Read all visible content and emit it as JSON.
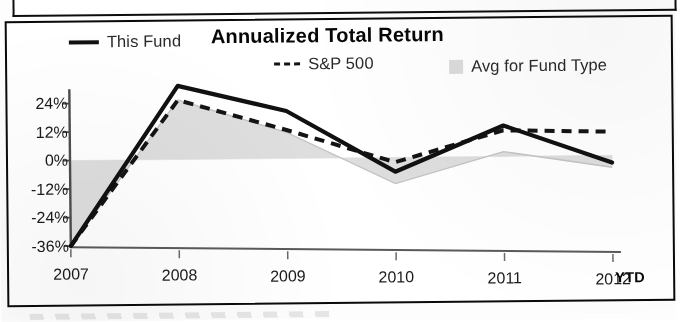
{
  "document": {
    "type": "scanned-fund-fact-sheet-excerpt"
  },
  "chart_data": {
    "type": "line",
    "title": "Annualized Total Return",
    "xlabel": "",
    "ylabel": "",
    "categories": [
      "2007",
      "2008",
      "2009",
      "2010",
      "2011",
      "2012"
    ],
    "x_axis_note": "YTD",
    "xtick_labels": [
      "2007",
      "2008",
      "2009",
      "2010",
      "2011",
      "2012"
    ],
    "ytick_labels": [
      "24%",
      "12%",
      "0%",
      "-12%",
      "-24%",
      "-36%"
    ],
    "ytick_values": [
      24,
      12,
      0,
      -12,
      -24,
      -36
    ],
    "ylim": [
      -38,
      34
    ],
    "grid": false,
    "legend_position": "top",
    "series": [
      {
        "name": "This Fund",
        "style": "solid",
        "color": "#111111",
        "values": [
          -36,
          31,
          20,
          -6,
          13,
          -3
        ]
      },
      {
        "name": "S&P 500",
        "style": "dashed",
        "color": "#141414",
        "values": [
          -36,
          25,
          12,
          -2,
          11,
          10
        ]
      },
      {
        "name": "Avg for Fund Type",
        "style": "filled-area",
        "color": "#dcdcdc",
        "values": [
          -36,
          25,
          11,
          -11,
          2,
          -5
        ]
      }
    ]
  },
  "legend": {
    "this_fund": "This Fund",
    "sp500": "S&P 500",
    "avg_fund_type": "Avg for Fund Type",
    "sp500_prefix": "---"
  },
  "axis": {
    "y": [
      "24%",
      "12%",
      "0%",
      "-12%",
      "-24%",
      "-36%"
    ],
    "x": [
      "2007",
      "2008",
      "2009",
      "2010",
      "2011",
      "2012"
    ],
    "ytd_label": "YTD"
  },
  "colors": {
    "this_fund": "#111111",
    "sp500": "#141414",
    "avg_area": "#dcdcdc",
    "axis": "#555555",
    "frame": "#0a0a0a"
  }
}
